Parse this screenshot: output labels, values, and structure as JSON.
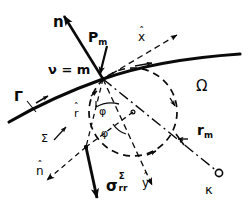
{
  "figure": {
    "background_color": "#ffffff",
    "ink_color": "#0a0a0a",
    "width": 251,
    "height": 218
  },
  "labels": {
    "normal_vector": "n",
    "point": "P",
    "point_sub": "m",
    "nu_equals_m": "ν = m",
    "boundary_curve": "Γ",
    "domain": "Ω",
    "x_hat": "x",
    "y_hat": "y",
    "n_hat": "n",
    "r_hat": "r",
    "hat_mark": "ˆ",
    "angle_phi": "φ",
    "angle_varrho": "φ",
    "sigma_symbol": "σ",
    "sigma_sub": "rr",
    "sigma_sup": "Σ",
    "sigma_circle": "Σ",
    "radius_label": "r",
    "radius_sub": "m",
    "kappa": "κ"
  },
  "geometry": {
    "point_Pm": [
      103,
      79
    ],
    "circle_center": [
      133,
      112
    ],
    "circle_radius": 44,
    "kappa_point": [
      218,
      172
    ],
    "sigma_point": [
      83,
      142
    ]
  },
  "line_styles": {
    "solid_curve": "solid",
    "vectors": "solid-bold",
    "axes": "dashed",
    "circle": "dashed",
    "radius_line": "dash-dot"
  }
}
